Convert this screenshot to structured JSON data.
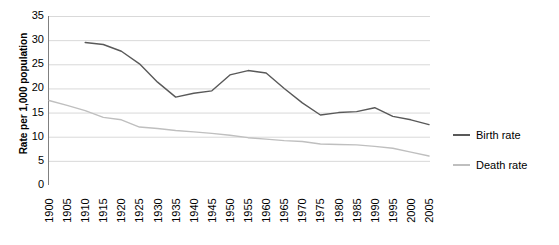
{
  "chart_data": {
    "type": "line",
    "title": "",
    "xlabel": "",
    "ylabel": "Rate per 1,000 population",
    "ylim": [
      0,
      35
    ],
    "yticks": [
      0,
      5,
      10,
      15,
      20,
      25,
      30,
      35
    ],
    "ytick_labels": [
      "0",
      "5",
      "10",
      "15",
      "20",
      "25",
      "30",
      "35"
    ],
    "grid": true,
    "grid_axis": "y",
    "legend_position": "right",
    "categories": [
      "1900",
      "1905",
      "1910",
      "1915",
      "1920",
      "1925",
      "1930",
      "1935",
      "1940",
      "1945",
      "1950",
      "1955",
      "1960",
      "1965",
      "1970",
      "1975",
      "1980",
      "1985",
      "1990",
      "1995",
      "2000",
      "2005"
    ],
    "x": [
      1900,
      1905,
      1910,
      1915,
      1920,
      1925,
      1930,
      1935,
      1940,
      1945,
      1950,
      1955,
      1960,
      1965,
      1970,
      1975,
      1980,
      1985,
      1990,
      1995,
      2000,
      2005
    ],
    "series": [
      {
        "name": "Birth rate",
        "color": "#595959",
        "values": [
          null,
          null,
          29.5,
          29.1,
          27.7,
          25.1,
          21.3,
          18.2,
          19.0,
          19.5,
          22.8,
          23.7,
          23.2,
          20.0,
          17.0,
          14.5,
          15.0,
          15.2,
          16.0,
          14.2,
          13.5,
          12.5
        ]
      },
      {
        "name": "Death rate",
        "color": "#BFBFBF",
        "values": [
          17.5,
          16.5,
          15.4,
          14.0,
          13.5,
          12.0,
          11.7,
          11.3,
          11.0,
          10.7,
          10.3,
          9.8,
          9.5,
          9.2,
          9.0,
          8.5,
          8.4,
          8.3,
          8.0,
          7.6,
          6.8,
          6.0
        ]
      }
    ]
  },
  "legend": {
    "items": [
      {
        "label": "Birth rate",
        "color": "#595959"
      },
      {
        "label": "Death rate",
        "color": "#BFBFBF"
      }
    ]
  },
  "colors": {
    "birth_rate": "#595959",
    "death_rate": "#BFBFBF",
    "gridline": "#D9D9D9",
    "axis": "#808080",
    "background": "#FFFFFF"
  }
}
